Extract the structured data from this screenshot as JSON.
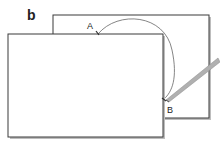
{
  "figure": {
    "panel_label": "b",
    "point_a_label": "A",
    "point_b_label": "B",
    "colors": {
      "outline": "#3a3a3a",
      "shadow": "#9a9a9a",
      "arc": "#555555",
      "pencil": "#a8a8a8",
      "background": "#ffffff"
    }
  }
}
